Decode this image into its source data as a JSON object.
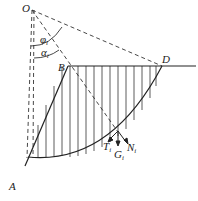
{
  "diagram": {
    "type": "slope stability slice method (Swedish circle)",
    "points": {
      "O": "O",
      "B": "B",
      "D": "D",
      "A": "A"
    },
    "angles": {
      "phi": "φ",
      "phi_sub": "i",
      "alpha": "α",
      "alpha_sub": "i"
    },
    "forces": {
      "T": "T",
      "T_sub": "i",
      "N": "N",
      "N_sub": "i",
      "G": "G",
      "G_sub": "i"
    },
    "colors": {
      "line": "#222222",
      "background": "#ffffff"
    }
  }
}
